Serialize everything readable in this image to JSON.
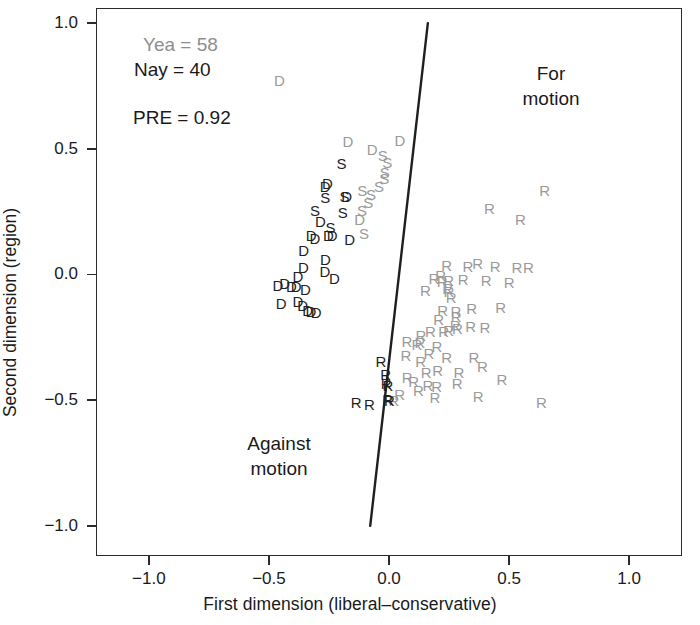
{
  "chart_data": {
    "type": "scatter",
    "title": "",
    "xlabel": "First dimension (liberal–conservative)",
    "ylabel": "Second dimension (region)",
    "xlim": [
      -1.22,
      1.22
    ],
    "ylim": [
      -1.12,
      1.06
    ],
    "xticks": [
      "-1.0",
      "-0.5",
      "0.0",
      "0.5",
      "1.0"
    ],
    "xtick_values": [
      -1.0,
      -0.5,
      0.0,
      0.5,
      1.0
    ],
    "yticks": [
      "1.0",
      "0.5",
      "0.0",
      "-0.5",
      "-1.0"
    ],
    "ytick_values": [
      1.0,
      0.5,
      0.0,
      -0.5,
      -1.0
    ],
    "grid": false,
    "legend_position": "none",
    "annotations": {
      "yea": "Yea = 58",
      "nay": "Nay = 40",
      "pre": "PRE = 0.92",
      "region_for": "For\nmotion",
      "region_against": "Against\nmotion"
    },
    "colors": {
      "yea": "#9a9a9a",
      "nay": "#1f1f1f",
      "frame": "#2b2b2b",
      "cutting_line": "#1f1f1f"
    },
    "counts": {
      "yea": 58,
      "nay": 40,
      "pre": 0.92
    },
    "cutting_line": {
      "x1": 0.1618,
      "y1": 1.0,
      "x2": -0.0782,
      "y2": -1.0
    },
    "series": [
      {
        "name": "Yea",
        "color": "#9a9a9a",
        "points": [
          {
            "label": "D",
            "x": -0.456,
            "y": 0.7745
          },
          {
            "label": "D",
            "x": -0.1715,
            "y": 0.5328
          },
          {
            "label": "D",
            "x": -0.0705,
            "y": 0.5
          },
          {
            "label": "S",
            "x": -0.0258,
            "y": 0.4745
          },
          {
            "label": "S",
            "x": -0.0074,
            "y": 0.4489
          },
          {
            "label": "D",
            "x": 0.045,
            "y": 0.5365
          },
          {
            "label": "S",
            "x": -0.0174,
            "y": 0.4088
          },
          {
            "label": "S",
            "x": -0.02,
            "y": 0.3832
          },
          {
            "label": "S",
            "x": -0.0411,
            "y": 0.3504
          },
          {
            "label": "S",
            "x": -0.1113,
            "y": 0.3358
          },
          {
            "label": "S",
            "x": -0.0751,
            "y": 0.3212
          },
          {
            "label": "S",
            "x": -0.0859,
            "y": 0.2883
          },
          {
            "label": "S",
            "x": -0.112,
            "y": 0.2555
          },
          {
            "label": "D",
            "x": -0.1223,
            "y": 0.219
          },
          {
            "label": "S",
            "x": -0.104,
            "y": 0.1642
          },
          {
            "label": "R",
            "x": 0.648,
            "y": 0.3358
          },
          {
            "label": "R",
            "x": 0.418,
            "y": 0.2628
          },
          {
            "label": "R",
            "x": 0.547,
            "y": 0.219
          },
          {
            "label": "R",
            "x": 0.24,
            "y": 0.0365
          },
          {
            "label": "R",
            "x": 0.329,
            "y": 0.0328
          },
          {
            "label": "R",
            "x": 0.369,
            "y": 0.0474
          },
          {
            "label": "R",
            "x": 0.442,
            "y": 0.0328
          },
          {
            "label": "R",
            "x": 0.533,
            "y": 0.0292
          },
          {
            "label": "R",
            "x": 0.581,
            "y": 0.0292
          },
          {
            "label": "R",
            "x": 0.187,
            "y": -0.0146
          },
          {
            "label": "R",
            "x": 0.215,
            "y": -0.0036
          },
          {
            "label": "R",
            "x": 0.221,
            "y": -0.0255
          },
          {
            "label": "R",
            "x": 0.248,
            "y": -0.0219
          },
          {
            "label": "R",
            "x": 0.309,
            "y": -0.0182
          },
          {
            "label": "R",
            "x": 0.405,
            "y": -0.0219
          },
          {
            "label": "R",
            "x": 0.5,
            "y": -0.0292
          },
          {
            "label": "R",
            "x": 0.152,
            "y": -0.062
          },
          {
            "label": "R",
            "x": 0.244,
            "y": -0.0547
          },
          {
            "label": "R",
            "x": 0.249,
            "y": -0.0657
          },
          {
            "label": "R",
            "x": 0.259,
            "y": -0.0912
          },
          {
            "label": "R",
            "x": 0.344,
            "y": -0.135
          },
          {
            "label": "R",
            "x": 0.465,
            "y": -0.1313
          },
          {
            "label": "R",
            "x": 0.223,
            "y": -0.1423
          },
          {
            "label": "R",
            "x": 0.279,
            "y": -0.146
          },
          {
            "label": "R",
            "x": 0.207,
            "y": -0.1788
          },
          {
            "label": "R",
            "x": 0.28,
            "y": -0.1642
          },
          {
            "label": "R",
            "x": 0.276,
            "y": -0.2007
          },
          {
            "label": "R",
            "x": 0.285,
            "y": -0.2117
          },
          {
            "label": "R",
            "x": 0.34,
            "y": -0.2044
          },
          {
            "label": "R",
            "x": 0.399,
            "y": -0.208
          },
          {
            "label": "R",
            "x": 0.133,
            "y": -0.2409
          },
          {
            "label": "R",
            "x": 0.172,
            "y": -0.2263
          },
          {
            "label": "R",
            "x": 0.228,
            "y": -0.2263
          },
          {
            "label": "R",
            "x": 0.248,
            "y": -0.219
          },
          {
            "label": "R",
            "x": 0.075,
            "y": -0.2628
          },
          {
            "label": "R",
            "x": 0.116,
            "y": -0.2774
          },
          {
            "label": "R",
            "x": 0.129,
            "y": -0.2701
          },
          {
            "label": "R",
            "x": 0.2,
            "y": -0.2847
          },
          {
            "label": "R",
            "x": 0.166,
            "y": -0.3139
          },
          {
            "label": "R",
            "x": 0.07,
            "y": -0.3212
          },
          {
            "label": "R",
            "x": 0.132,
            "y": -0.3431
          },
          {
            "label": "R",
            "x": 0.24,
            "y": -0.3285
          },
          {
            "label": "R",
            "x": 0.354,
            "y": -0.3285
          },
          {
            "label": "R",
            "x": 0.155,
            "y": -0.3869
          },
          {
            "label": "R",
            "x": 0.203,
            "y": -0.3796
          },
          {
            "label": "R",
            "x": 0.291,
            "y": -0.3869
          },
          {
            "label": "R",
            "x": 0.389,
            "y": -0.365
          },
          {
            "label": "R",
            "x": 0.076,
            "y": -0.4088
          },
          {
            "label": "R",
            "x": 0.103,
            "y": -0.4234
          },
          {
            "label": "R",
            "x": 0.162,
            "y": -0.438
          },
          {
            "label": "R",
            "x": 0.199,
            "y": -0.4453
          },
          {
            "label": "R",
            "x": 0.284,
            "y": -0.4307
          },
          {
            "label": "R",
            "x": 0.47,
            "y": -0.4161
          },
          {
            "label": "R",
            "x": 0.044,
            "y": -0.4745
          },
          {
            "label": "R",
            "x": 0.123,
            "y": -0.4599
          },
          {
            "label": "R",
            "x": 0.191,
            "y": -0.4891
          },
          {
            "label": "R",
            "x": 0.371,
            "y": -0.4818
          },
          {
            "label": "R",
            "x": 0.635,
            "y": -0.5073
          },
          {
            "label": "R",
            "x": 0.02,
            "y": -0.5
          }
        ]
      },
      {
        "name": "Nay",
        "color": "#1f1f1f",
        "points": [
          {
            "label": "S",
            "x": -0.198,
            "y": 0.4453
          },
          {
            "label": "D",
            "x": -0.256,
            "y": 0.365
          },
          {
            "label": "D",
            "x": -0.266,
            "y": 0.3504
          },
          {
            "label": "S",
            "x": -0.265,
            "y": 0.3066
          },
          {
            "label": "S",
            "x": -0.185,
            "y": 0.3139
          },
          {
            "label": "D",
            "x": -0.176,
            "y": 0.3103
          },
          {
            "label": "S",
            "x": -0.308,
            "y": 0.2555
          },
          {
            "label": "S",
            "x": -0.192,
            "y": 0.2482
          },
          {
            "label": "D",
            "x": -0.286,
            "y": 0.2117
          },
          {
            "label": "D",
            "x": -0.324,
            "y": 0.1569
          },
          {
            "label": "D",
            "x": -0.308,
            "y": 0.146
          },
          {
            "label": "D",
            "x": -0.252,
            "y": 0.1569
          },
          {
            "label": "D",
            "x": -0.237,
            "y": 0.1569
          },
          {
            "label": "D",
            "x": -0.164,
            "y": 0.1423
          },
          {
            "label": "D",
            "x": -0.265,
            "y": 0.062
          },
          {
            "label": "D",
            "x": -0.356,
            "y": 0.0292
          },
          {
            "label": "D",
            "x": -0.267,
            "y": 0.0146
          },
          {
            "label": "D",
            "x": -0.379,
            "y": -0.0073
          },
          {
            "label": "D",
            "x": -0.227,
            "y": -0.0146
          },
          {
            "label": "D",
            "x": -0.434,
            "y": -0.0328
          },
          {
            "label": "D",
            "x": -0.463,
            "y": -0.0401
          },
          {
            "label": "D",
            "x": -0.406,
            "y": -0.0474
          },
          {
            "label": "D",
            "x": -0.387,
            "y": -0.0474
          },
          {
            "label": "D",
            "x": -0.348,
            "y": -0.0584
          },
          {
            "label": "D",
            "x": -0.449,
            "y": -0.1131
          },
          {
            "label": "D",
            "x": -0.379,
            "y": -0.1058
          },
          {
            "label": "D",
            "x": -0.359,
            "y": -0.1204
          },
          {
            "label": "D",
            "x": -0.339,
            "y": -0.1423
          },
          {
            "label": "D",
            "x": -0.325,
            "y": -0.146
          },
          {
            "label": "R",
            "x": -0.034,
            "y": -0.3431
          },
          {
            "label": "R",
            "x": -0.014,
            "y": -0.3942
          },
          {
            "label": "R",
            "x": -0.012,
            "y": -0.4307
          },
          {
            "label": "R",
            "x": -0.004,
            "y": -0.438
          },
          {
            "label": "R",
            "x": -0.006,
            "y": -0.4964
          },
          {
            "label": "R",
            "x": 0.002,
            "y": -0.5
          },
          {
            "label": "R",
            "x": -0.137,
            "y": -0.5073
          },
          {
            "label": "R",
            "x": -0.082,
            "y": -0.5146
          },
          {
            "label": "D",
            "x": -0.355,
            "y": 0.0985
          },
          {
            "label": "S",
            "x": -0.243,
            "y": 0.1898
          },
          {
            "label": "D",
            "x": -0.303,
            "y": -0.1496
          }
        ]
      }
    ]
  }
}
